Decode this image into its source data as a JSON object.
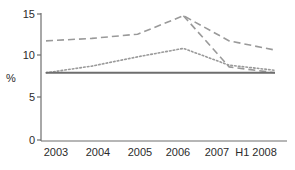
{
  "chart_data": {
    "type": "line",
    "title": "",
    "subtitle": "",
    "xlabel": "",
    "ylabel": "%",
    "categories": [
      "2003",
      "2004",
      "2005",
      "2006",
      "2007",
      "H1 2008"
    ],
    "x": [
      2003,
      2004,
      2005,
      2006,
      2007,
      2008
    ],
    "ylim": [
      0,
      15
    ],
    "xlim": [
      2003,
      2008
    ],
    "yticks": [
      0,
      5,
      10,
      15
    ],
    "ytick_labels": [
      "0",
      "5",
      "10",
      "15"
    ],
    "xtick_labels": [
      "2003",
      "2004",
      "2005",
      "2006",
      "2007",
      "H1 2008"
    ],
    "grid": false,
    "legend": "none",
    "series": [
      {
        "name": "series-dashed-upper",
        "style": "dashed",
        "color": "#9a9a9a",
        "values": [
          11.8,
          12.1,
          12.6,
          14.8,
          11.8,
          10.7
        ]
      },
      {
        "name": "series-dashed-lower",
        "style": "dashed",
        "color": "#9a9a9a",
        "values": [
          null,
          null,
          null,
          14.8,
          8.7,
          8.0
        ]
      },
      {
        "name": "series-dotted",
        "style": "dotted",
        "color": "#9a9a9a",
        "values": [
          8.0,
          8.8,
          9.9,
          10.9,
          8.9,
          8.3
        ]
      },
      {
        "name": "series-solid-flat",
        "style": "solid",
        "color": "#6e6e6e",
        "values": [
          8.0,
          8.0,
          8.0,
          8.0,
          8.0,
          8.0
        ]
      }
    ]
  },
  "axis": {
    "y_title": "%",
    "y_tick_0": "0",
    "y_tick_1": "5",
    "y_tick_2": "10",
    "y_tick_3": "15",
    "x_tick_0": "2003",
    "x_tick_1": "2004",
    "x_tick_2": "2005",
    "x_tick_3": "2006",
    "x_tick_4": "2007",
    "x_tick_5": "H1 2008"
  },
  "colors": {
    "axis": "#6e6e6e",
    "text": "#2b2b2b",
    "dashed": "#9a9a9a",
    "dotted": "#9a9a9a",
    "solid": "#6e6e6e",
    "background": "#ffffff"
  }
}
